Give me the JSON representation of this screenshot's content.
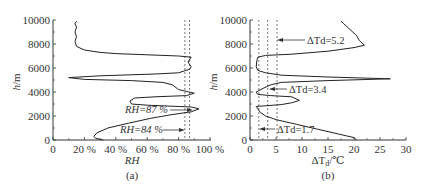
{
  "chart_data": [
    {
      "panel": "(a)",
      "type": "line",
      "xlabel": "RH",
      "ylabel": "h/m",
      "xlim": [
        0,
        100
      ],
      "ylim": [
        0,
        10000
      ],
      "xticks": [
        "0",
        "20 %",
        "40 %",
        "60 %",
        "80 %",
        "100 %"
      ],
      "yticks": [
        "0",
        "2000",
        "4000",
        "6000",
        "8000",
        "10000"
      ],
      "grid": false,
      "series": [
        {
          "name": "RH profile",
          "points": [
            [
              32,
              0
            ],
            [
              27,
              150
            ],
            [
              26,
              300
            ],
            [
              28,
              600
            ],
            [
              35,
              1000
            ],
            [
              48,
              1400
            ],
            [
              62,
              1800
            ],
            [
              75,
              2100
            ],
            [
              88,
              2350
            ],
            [
              93,
              2600
            ],
            [
              88,
              2750
            ],
            [
              60,
              2900
            ],
            [
              50,
              3000
            ],
            [
              49,
              3250
            ],
            [
              52,
              3500
            ],
            [
              65,
              3600
            ],
            [
              85,
              3700
            ],
            [
              90,
              3900
            ],
            [
              80,
              4200
            ],
            [
              76,
              4600
            ],
            [
              70,
              4800
            ],
            [
              50,
              4950
            ],
            [
              20,
              5050
            ],
            [
              10,
              5200
            ],
            [
              30,
              5350
            ],
            [
              65,
              5500
            ],
            [
              80,
              5600
            ],
            [
              87,
              5900
            ],
            [
              88,
              6100
            ],
            [
              86,
              6500
            ],
            [
              88,
              6900
            ],
            [
              80,
              7000
            ],
            [
              60,
              7100
            ],
            [
              40,
              7200
            ],
            [
              30,
              7300
            ],
            [
              20,
              7500
            ],
            [
              15,
              7800
            ],
            [
              14,
              8200
            ],
            [
              15,
              8600
            ],
            [
              14,
              9000
            ],
            [
              15,
              9400
            ],
            [
              14,
              9700
            ],
            [
              15,
              9900
            ]
          ]
        }
      ],
      "reference_lines": [
        {
          "label": "RH=84 %",
          "x": 84,
          "style": "dashed"
        },
        {
          "label": "RH=87 %",
          "x": 87,
          "style": "dashed"
        }
      ],
      "annotations": [
        "RH=87 %",
        "RH=84 %"
      ]
    },
    {
      "panel": "(b)",
      "type": "line",
      "xlabel": "ΔTd/℃",
      "ylabel": "h/m",
      "xlim": [
        0,
        30
      ],
      "ylim": [
        0,
        10000
      ],
      "xticks": [
        "0",
        "5",
        "10",
        "15",
        "20",
        "25",
        "30"
      ],
      "yticks": [
        "0",
        "2000",
        "4000",
        "6000",
        "8000",
        "10000"
      ],
      "grid": false,
      "series": [
        {
          "name": "Dew-point depression profile",
          "points": [
            [
              20.5,
              0
            ],
            [
              20,
              200
            ],
            [
              17,
              500
            ],
            [
              13,
              900
            ],
            [
              9,
              1300
            ],
            [
              5,
              1700
            ],
            [
              3,
              2000
            ],
            [
              2,
              2300
            ],
            [
              1.5,
              2600
            ],
            [
              1.2,
              2800
            ],
            [
              3,
              2850
            ],
            [
              6,
              2950
            ],
            [
              8,
              3100
            ],
            [
              9.5,
              3300
            ],
            [
              8,
              3600
            ],
            [
              4,
              3700
            ],
            [
              1.5,
              3800
            ],
            [
              1.2,
              4000
            ],
            [
              2.5,
              4300
            ],
            [
              4,
              4600
            ],
            [
              6,
              4800
            ],
            [
              15,
              4950
            ],
            [
              27,
              5100
            ],
            [
              15,
              5250
            ],
            [
              6,
              5400
            ],
            [
              3,
              5600
            ],
            [
              1.5,
              5800
            ],
            [
              1.2,
              6100
            ],
            [
              1.3,
              6600
            ],
            [
              1.5,
              6900
            ],
            [
              3,
              7050
            ],
            [
              8,
              7150
            ],
            [
              15,
              7400
            ],
            [
              20,
              7700
            ],
            [
              22,
              7900
            ],
            [
              21,
              8300
            ],
            [
              20.5,
              8700
            ],
            [
              19,
              9300
            ],
            [
              18,
              9700
            ],
            [
              17.5,
              9900
            ]
          ]
        }
      ],
      "reference_lines": [
        {
          "label": "ΔTd=1.7",
          "x": 1.7,
          "style": "dashed"
        },
        {
          "label": "ΔTd=3.4",
          "x": 3.4,
          "style": "dashed"
        },
        {
          "label": "ΔTd=5.2",
          "x": 5.2,
          "style": "dashed"
        }
      ],
      "annotations": [
        "ΔTd=5.2",
        "ΔTd=3.4",
        "ΔTd=1.7"
      ]
    }
  ],
  "labels": {
    "a": {
      "caption": "(a)",
      "xlabel": "RH",
      "ylabel_h": "h",
      "ylabel_unit": "/m",
      "ann_87": "RH=87 %",
      "ann_84": "RH=84 %"
    },
    "b": {
      "caption": "(b)",
      "xlabel_main": "ΔT",
      "xlabel_sub": "d",
      "xlabel_unit": "/℃",
      "ylabel_h": "h",
      "ylabel_unit": "/m",
      "ann_52": "ΔTd=5.2",
      "ann_34": "ΔTd=3.4",
      "ann_17": "ΔTd=1.7"
    }
  }
}
